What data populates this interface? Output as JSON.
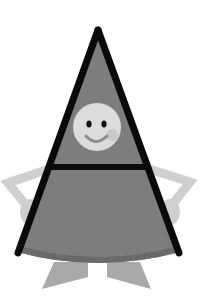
{
  "illustration": {
    "subject": "triangle-person-with-smiley-face",
    "colors": {
      "background": "#ffffff",
      "body_fill": "#7d7d7d",
      "skirt_hem": "#6a6a6a",
      "outline": "#0a0a0a",
      "face_fill": "#dcdcdc",
      "face_features": "#111111",
      "smile": "#8e8e8e",
      "cheek": "#c4c4c4",
      "limbs": "#cfcfcf",
      "feet": "#a9a9a9"
    }
  }
}
